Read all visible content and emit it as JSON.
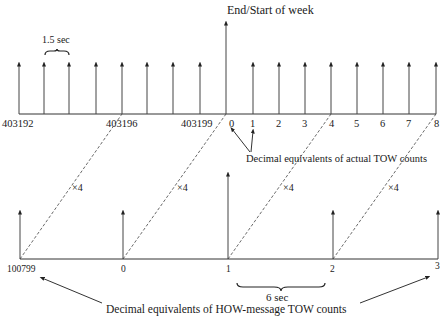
{
  "title": "End/Start of week",
  "top_axis": {
    "labels": [
      {
        "text": "403192",
        "x": 2,
        "y": 127
      },
      {
        "text": "403196",
        "x": 106,
        "y": 127
      },
      {
        "text": "403199",
        "x": 181,
        "y": 127
      },
      {
        "text": "0",
        "x": 229,
        "y": 127
      },
      {
        "text": "1",
        "x": 250,
        "y": 127
      },
      {
        "text": "2",
        "x": 276,
        "y": 127
      },
      {
        "text": "3",
        "x": 302,
        "y": 127
      },
      {
        "text": "4",
        "x": 329,
        "y": 127
      },
      {
        "text": "5",
        "x": 354,
        "y": 127
      },
      {
        "text": "6",
        "x": 380,
        "y": 127
      },
      {
        "text": "7",
        "x": 406,
        "y": 127
      },
      {
        "text": "8",
        "x": 434,
        "y": 127
      }
    ],
    "ticks_x": [
      19,
      44,
      69,
      96,
      122,
      147,
      173,
      200,
      226,
      253,
      279,
      305,
      331,
      357,
      383,
      409,
      436
    ],
    "tall_tick_x": 226,
    "interval_label": "1.5 sec",
    "pointer_label": "Decimal equivalents of actual TOW counts"
  },
  "bottom_axis": {
    "labels": [
      {
        "text": "100799",
        "x": 7,
        "y": 272
      },
      {
        "text": "0",
        "x": 121,
        "y": 272
      },
      {
        "text": "1",
        "x": 226,
        "y": 272
      },
      {
        "text": "2",
        "x": 330,
        "y": 272
      },
      {
        "text": "3",
        "x": 435,
        "y": 269
      }
    ],
    "ticks_x": [
      20,
      123,
      228,
      333,
      438
    ],
    "tall_tick_x": 228,
    "interval_label": "6 sec",
    "pointer_label": "Decimal equivalents of HOW-message TOW counts"
  },
  "multiplier_label": "×4",
  "multipliers": [
    {
      "text": "×4",
      "x": 72,
      "y": 191
    },
    {
      "text": "×4",
      "x": 177,
      "y": 191
    },
    {
      "text": "×4",
      "x": 283,
      "y": 191
    },
    {
      "text": "×4",
      "x": 388,
      "y": 191
    }
  ]
}
